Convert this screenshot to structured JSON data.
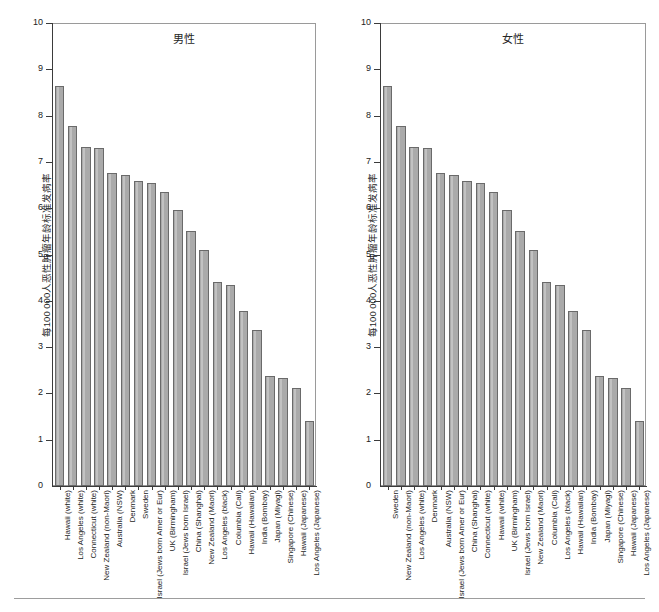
{
  "figure": {
    "background": "#ffffff",
    "bar_fill": "#aaaaaa",
    "bar_stroke": "#6a6a6a",
    "axis_color": "#3b3b3b",
    "footer_rule": true
  },
  "y_axis": {
    "title": "每100 000人恶性肿瘤年龄标准发病率",
    "ticks": [
      "0",
      "1",
      "2",
      "3",
      "4",
      "5",
      "6",
      "7",
      "8",
      "9",
      "10"
    ],
    "min": 0,
    "max": 10
  },
  "chart_data": [
    {
      "type": "bar",
      "title": "男性",
      "xlabel": "",
      "ylabel": "每100 000人恶性肿瘤年龄标准发病率",
      "ylim": [
        0,
        10
      ],
      "grid": false,
      "legend": "none",
      "categories": [
        "Hawaii (white)",
        "Los Angeles (white)",
        "Connecticut (white)",
        "New Zealand (non-Maori)",
        "Australia (NSW)",
        "Denmark",
        "Sweden",
        "Israel (Jews born Amer or Eur)",
        "UK (Birmingham)",
        "Israel (Jews born Israel)",
        "China (Shanghai)",
        "New Zealand (Maori)",
        "Los Angeles (black)",
        "Columbia (Cali)",
        "Hawaii (Hawaiian)",
        "India (Bombay)",
        "Japan (Miyagi)",
        "Singapore (Chinese)",
        "Hawaii (Japanese)",
        "Los Angeles (Japanese)"
      ],
      "values": [
        8.65,
        7.77,
        7.33,
        7.29,
        6.77,
        6.71,
        6.58,
        6.54,
        6.35,
        5.97,
        5.51,
        5.1,
        4.4,
        4.34,
        3.77,
        3.36,
        2.38,
        2.33,
        2.12,
        1.4
      ]
    },
    {
      "type": "bar",
      "title": "女性",
      "xlabel": "",
      "ylabel": "每100 000人恶性肿瘤年龄标准发病率",
      "ylim": [
        0,
        10
      ],
      "grid": false,
      "legend": "none",
      "categories": [
        "Sweden",
        "New Zealand (non-Maori)",
        "Los Angeles (white)",
        "Denmark",
        "Australia (NSW)",
        "Israel (Jews born Amer or Eur)",
        "China (Shanghai)",
        "Connecticut (white)",
        "Hawaii (white)",
        "UK (Birmingham)",
        "Israel (Jews born Israel)",
        "New Zealand (Maori)",
        "Columbia (Cali)",
        "Los Angeles (black)",
        "Hawaii (Hawaiian)",
        "India (Bombay)",
        "Japan (Miyagi)",
        "Singapore (Chinese)",
        "Hawaii (Japanese)",
        "Los Angeles (Japanese)"
      ],
      "values": [
        8.65,
        7.77,
        7.33,
        7.29,
        6.77,
        6.71,
        6.58,
        6.54,
        6.35,
        5.97,
        5.51,
        5.1,
        4.4,
        4.34,
        3.77,
        3.36,
        2.38,
        2.33,
        2.12,
        1.4
      ]
    }
  ]
}
